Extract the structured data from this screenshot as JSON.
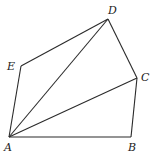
{
  "diagram": {
    "type": "geometry",
    "points": {
      "A": {
        "label": "A",
        "x": 9,
        "y": 137,
        "lx": 4,
        "ly": 151
      },
      "B": {
        "label": "B",
        "x": 131,
        "y": 137,
        "lx": 128,
        "ly": 151
      },
      "C": {
        "label": "C",
        "x": 137,
        "y": 78,
        "lx": 141,
        "ly": 81
      },
      "D": {
        "label": "D",
        "x": 108,
        "y": 19,
        "lx": 108,
        "ly": 14
      },
      "E": {
        "label": "E",
        "x": 21,
        "y": 66,
        "lx": 7,
        "ly": 70
      }
    },
    "segments": [
      [
        "A",
        "B"
      ],
      [
        "B",
        "C"
      ],
      [
        "C",
        "D"
      ],
      [
        "D",
        "E"
      ],
      [
        "E",
        "A"
      ],
      [
        "A",
        "C"
      ],
      [
        "A",
        "D"
      ]
    ]
  }
}
